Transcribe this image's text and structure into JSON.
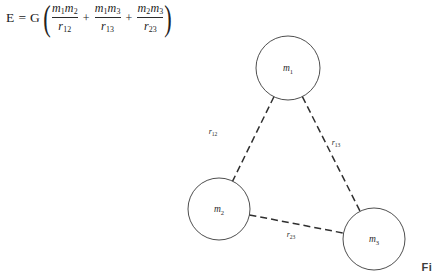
{
  "formula": {
    "lhs": "E",
    "equals": "=",
    "constant": "G",
    "paren_open": "(",
    "paren_close": ")",
    "plus": "+",
    "terms": [
      {
        "numerator_m_a": "m",
        "numerator_sub_a": "1",
        "numerator_m_b": "m",
        "numerator_sub_b": "2",
        "denominator_r": "r",
        "denominator_sub": "12"
      },
      {
        "numerator_m_a": "m",
        "numerator_sub_a": "1",
        "numerator_m_b": "m",
        "numerator_sub_b": "3",
        "denominator_r": "r",
        "denominator_sub": "13"
      },
      {
        "numerator_m_a": "m",
        "numerator_sub_a": "2",
        "numerator_m_b": "m",
        "numerator_sub_b": "3",
        "denominator_r": "r",
        "denominator_sub": "23"
      }
    ],
    "plain_text": "E = G( m1m2/r12 + m1m3/r13 + m2m3/r23 )"
  },
  "diagram": {
    "type": "three-body-gravitational-diagram",
    "stroke_color": "#3a3a3a",
    "edge_color": "#2f2f2f",
    "background_color": "#ffffff",
    "nodes": [
      {
        "id": "m1",
        "label_base": "m",
        "label_sub": "1",
        "cx": 288,
        "cy": 68,
        "r": 32
      },
      {
        "id": "m2",
        "label_base": "m",
        "label_sub": "2",
        "cx": 219,
        "cy": 209,
        "r": 31
      },
      {
        "id": "m3",
        "label_base": "m",
        "label_sub": "3",
        "cx": 374,
        "cy": 239,
        "r": 31
      }
    ],
    "edges": [
      {
        "id": "r12",
        "from": "m1",
        "to": "m2",
        "label_base": "r",
        "label_sub": "12",
        "label_x": 213,
        "label_y": 134
      },
      {
        "id": "r13",
        "from": "m1",
        "to": "m3",
        "label_base": "r",
        "label_sub": "13",
        "label_x": 336,
        "label_y": 145
      },
      {
        "id": "r23",
        "from": "m2",
        "to": "m3",
        "label_base": "r",
        "label_sub": "23",
        "label_x": 291,
        "label_y": 237
      }
    ]
  },
  "caption": {
    "fragment": "Fi"
  }
}
